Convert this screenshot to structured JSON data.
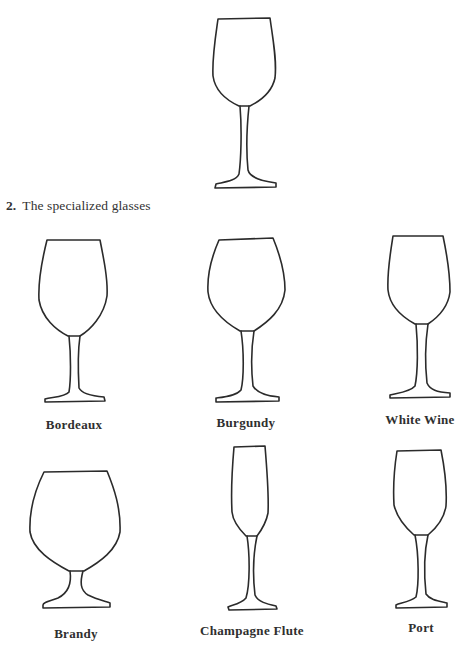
{
  "section": {
    "number": "2.",
    "title": "The specialized glasses"
  },
  "glasses": [
    {
      "id": "all-purpose",
      "label": ""
    },
    {
      "id": "bordeaux",
      "label": "Bordeaux"
    },
    {
      "id": "burgundy",
      "label": "Burgundy"
    },
    {
      "id": "white-wine",
      "label": "White Wine"
    },
    {
      "id": "brandy",
      "label": "Brandy"
    },
    {
      "id": "champagne-flute",
      "label": "Champagne Flute"
    },
    {
      "id": "port",
      "label": "Port"
    }
  ]
}
